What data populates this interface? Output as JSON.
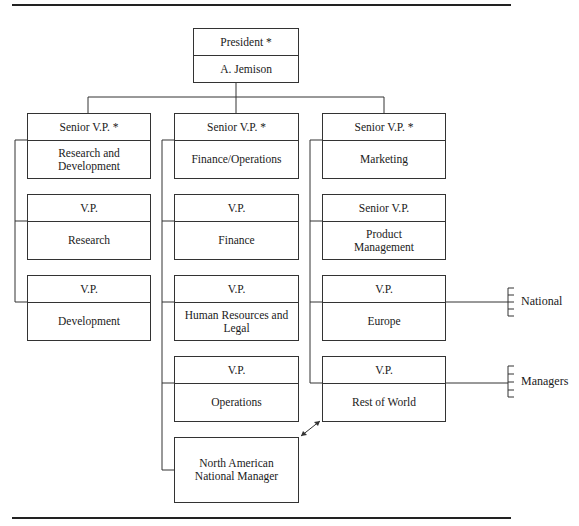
{
  "chart": {
    "president": {
      "title": "President *",
      "name": "A. Jemison"
    },
    "columns": [
      {
        "head": {
          "title": "Senior V.P. *",
          "unit": "Research and\nDevelopment"
        },
        "reports": [
          {
            "title": "V.P.",
            "unit": "Research"
          },
          {
            "title": "V.P.",
            "unit": "Development"
          }
        ]
      },
      {
        "head": {
          "title": "Senior V.P. *",
          "unit": "Finance/Operations"
        },
        "reports": [
          {
            "title": "V.P.",
            "unit": "Finance"
          },
          {
            "title": "V.P.",
            "unit": "Human Resources and Legal"
          },
          {
            "title": "V.P.",
            "unit": "Operations"
          }
        ],
        "extra": {
          "unit": "North American\nNational Manager"
        }
      },
      {
        "head": {
          "title": "Senior V.P. *",
          "unit": "Marketing"
        },
        "reports": [
          {
            "title": "Senior V.P.",
            "unit": "Product\nManagement"
          },
          {
            "title": "V.P.",
            "unit": "Europe"
          },
          {
            "title": "V.P.",
            "unit": "Rest of World"
          }
        ]
      }
    ],
    "side_labels": {
      "line1": "National",
      "line2": "Managers"
    }
  },
  "colors": {
    "line": "#333333",
    "background": "#ffffff",
    "text": "#1a1a1a"
  }
}
